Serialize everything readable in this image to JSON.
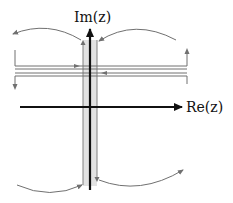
{
  "diagram": {
    "axes": {
      "imag_label": "Im(z)",
      "real_label": "Re(z)"
    },
    "colors": {
      "axis": "#111111",
      "contour": "#707070",
      "strip_fill": "#e2e2e2",
      "background": "#ffffff"
    },
    "elements": [
      {
        "id": "imag-axis",
        "type": "arrow",
        "direction": "up"
      },
      {
        "id": "real-axis",
        "type": "arrow",
        "direction": "right"
      },
      {
        "id": "branch-cut-strip",
        "type": "shaded-vertical-strip"
      },
      {
        "id": "horizontal-contour-pair",
        "type": "parallel-lines",
        "upper_arrow": "right",
        "lower_arrow": "left"
      },
      {
        "id": "left-end-segment",
        "type": "vertical-line",
        "arrow": "down"
      },
      {
        "id": "right-end-segment",
        "type": "vertical-line",
        "arrow": "up"
      },
      {
        "id": "upper-left-arc",
        "type": "arc",
        "arrow": "outward-left"
      },
      {
        "id": "upper-right-arc",
        "type": "arc",
        "arrow": "inward-to-strip"
      },
      {
        "id": "lower-left-arc",
        "type": "arc",
        "arrow": "inward-to-strip"
      },
      {
        "id": "lower-right-arc",
        "type": "arc",
        "arrow": "outward-right"
      }
    ]
  }
}
